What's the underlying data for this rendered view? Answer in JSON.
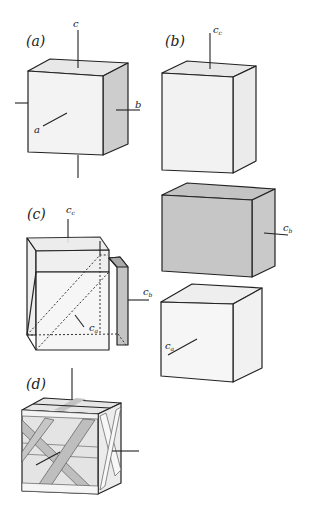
{
  "figure": {
    "panels": [
      {
        "id": "a",
        "label": "(a)",
        "axes": {
          "c": "c",
          "b": "b",
          "a": "a"
        }
      },
      {
        "id": "b",
        "label": "(b)",
        "axes": {
          "cc": "c",
          "cc_sub": "c",
          "cb": "c",
          "cb_sub": "b",
          "ca": "c",
          "ca_sub": "a"
        }
      },
      {
        "id": "c",
        "label": "(c)",
        "axes": {
          "cc": "c",
          "cc_sub": "c",
          "cb": "c",
          "cb_sub": "b",
          "ca": "c",
          "ca_sub": "a"
        }
      },
      {
        "id": "d",
        "label": "(d)"
      }
    ],
    "colors": {
      "face_light": "#f2f2f2",
      "face_top": "#e6e6e6",
      "face_side": "#cfcfcf",
      "face_grey": "#c8c8c8",
      "strap": "#bdbdbd",
      "line": "#222222"
    }
  }
}
